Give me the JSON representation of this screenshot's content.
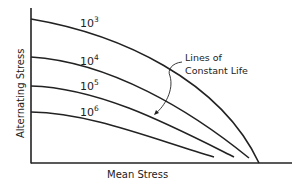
{
  "diagram": {
    "x_axis_label": "Mean Stress",
    "y_axis_label": "Alternating Stress",
    "annotation": {
      "line1": "Lines of",
      "line2": "Constant Life"
    },
    "curves": [
      {
        "base": "10",
        "exp": "3"
      },
      {
        "base": "10",
        "exp": "4"
      },
      {
        "base": "10",
        "exp": "5"
      },
      {
        "base": "10",
        "exp": "6"
      }
    ],
    "colors": {
      "line": "#222222",
      "background": "#ffffff"
    }
  }
}
